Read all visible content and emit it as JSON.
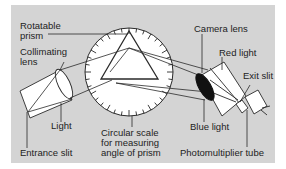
{
  "diagram": {
    "colors": {
      "background": "#d4d4d4",
      "stroke": "#2a2a2a",
      "fill": "#ffffff",
      "lens_dark": "#111111"
    },
    "labels": {
      "rotatable_prism_1": "Rotatable",
      "rotatable_prism_2": "prism",
      "collimating_lens_1": "Collimating",
      "collimating_lens_2": "lens",
      "camera_lens": "Camera lens",
      "red_light": "Red light",
      "exit_slit": "Exit slit",
      "light": "Light",
      "entrance_slit": "Entrance slit",
      "circular_scale_1": "Circular scale",
      "circular_scale_2": "for measuring",
      "circular_scale_3": "angle of prism",
      "blue_light": "Blue light",
      "photomultiplier_tube": "Photomultiplier tube"
    }
  }
}
